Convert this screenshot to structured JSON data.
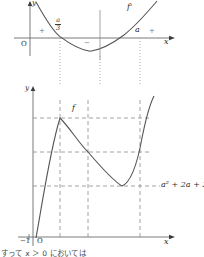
{
  "figure": {
    "title_hidden": "",
    "upper_graph": {
      "curve_label": "f'",
      "axis_x_label": "x",
      "axis_y_label": "y",
      "origin_label": "O",
      "tick_labels": {
        "root_left_num": "a",
        "root_left_den": "3",
        "root_right": "a"
      },
      "sign_left": "+",
      "sign_middle": "−",
      "sign_right": "+"
    },
    "lower_graph": {
      "curve_label": "f",
      "axis_x_label": "x",
      "axis_y_label": "y",
      "origin_label": "O",
      "left_tick_label": "−1",
      "min_value_label": "a² + 2a + 3"
    },
    "footer_note": "すって  x ＞ 0 においては"
  },
  "colors": {
    "curve": "#555555",
    "axis": "#6b6b6b",
    "dashed": "#8a8a8a",
    "dotted": "#9a9a9a",
    "text": "#2b2b2b",
    "sign": "#777777"
  }
}
